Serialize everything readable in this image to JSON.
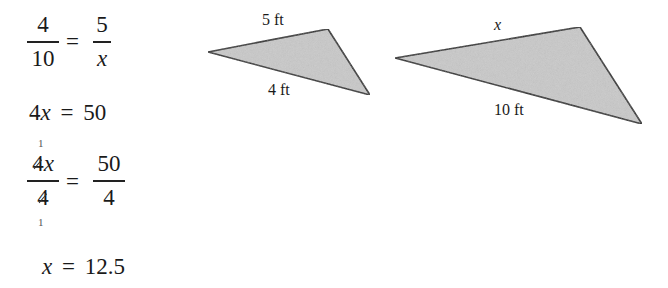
{
  "solution_steps": {
    "step1": {
      "left_num": "4",
      "left_den": "10",
      "equals": "=",
      "right_num": "5",
      "right_den": "x"
    },
    "step2": {
      "coef": "4",
      "var": "x",
      "equals": "=",
      "rhs": "50"
    },
    "step3": {
      "left_num_coef": "4",
      "left_num_var": "x",
      "left_den": "4",
      "cancel_mark_top": "1",
      "cancel_mark_bottom": "1",
      "equals": "=",
      "right_num": "50",
      "right_den": "4"
    },
    "step4": {
      "var": "x",
      "equals": "=",
      "rhs": "12.5"
    }
  },
  "figures": {
    "small_triangle": {
      "top_side_label": "5 ft",
      "bottom_side_label": "4 ft",
      "fill": "#c8c8c8",
      "stroke": "#222222"
    },
    "large_triangle": {
      "top_side_label": "x",
      "bottom_side_label": "10 ft",
      "fill": "#c8c8c8",
      "stroke": "#222222"
    }
  }
}
